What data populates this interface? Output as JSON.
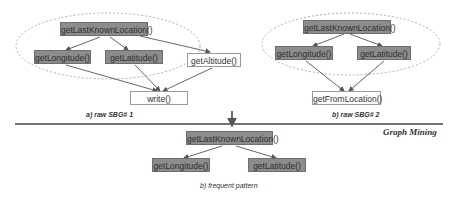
{
  "graph_a": {
    "caption": "a) raw SBG# 1",
    "nodes": {
      "root": "getLastKnownLocation()",
      "left": "getLongitude()",
      "right": "getLatitude()",
      "extra": "getAltitude()",
      "sink": "write()"
    }
  },
  "graph_b": {
    "caption": "b) raw SBG# 2",
    "nodes": {
      "root": "getLastKnownLocation()",
      "left": "getLongitude()",
      "right": "getLatitude()",
      "sink": "getFromLocation()"
    }
  },
  "stage_label": "Graph Mining",
  "pattern": {
    "caption": "b) frequent pattern",
    "nodes": {
      "root": "getLastKnownLocation()",
      "left": "getLongitude()",
      "right": "getLatitude()"
    }
  },
  "colors": {
    "frequent_fill": "#8c8c8c",
    "edge": "#555555",
    "ellipse": "#9a9a9a"
  }
}
